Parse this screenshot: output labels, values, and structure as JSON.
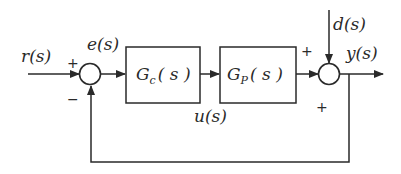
{
  "diagram": {
    "type": "feedback-control-block-diagram",
    "signals": {
      "reference": "r(s)",
      "error": "e(s)",
      "control": "u(s)",
      "disturbance": "d(s)",
      "output": "y(s)"
    },
    "blocks": {
      "controller": {
        "name": "G",
        "sub": "c",
        "arg": "( s )"
      },
      "plant": {
        "name": "G",
        "sub": "P",
        "arg": "( s )"
      }
    },
    "summing_junctions": {
      "left": {
        "top_sign": "+",
        "bottom_sign": "−"
      },
      "right": {
        "left_sign": "+",
        "bottom_sign": "+"
      }
    },
    "colors": {
      "stroke": "#2a2a2a",
      "background": "#ffffff"
    }
  }
}
